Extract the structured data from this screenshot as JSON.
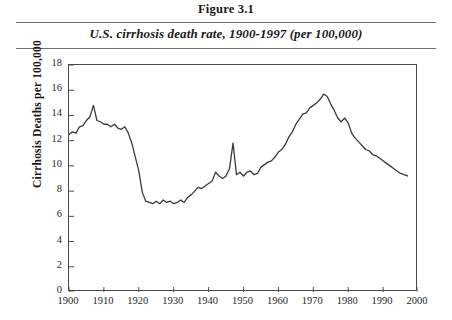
{
  "header": {
    "figure_number": "Figure 3.1",
    "title": "U.S. cirrhosis death rate, 1900-1997 (per 100,000)"
  },
  "chart_data": {
    "type": "line",
    "title": "U.S. cirrhosis death rate, 1900-1997 (per 100,000)",
    "figure_number": "Figure 3.1",
    "xlabel": "",
    "ylabel": "Cirrhosis Deaths per 100,000",
    "xlim": [
      1900,
      2000
    ],
    "ylim": [
      0,
      18
    ],
    "xticks": [
      1900,
      1910,
      1920,
      1930,
      1940,
      1950,
      1960,
      1970,
      1980,
      1990,
      2000
    ],
    "yticks": [
      0,
      2,
      4,
      6,
      8,
      10,
      12,
      14,
      16,
      18
    ],
    "xtick_labels": [
      "1900",
      "1910",
      "1920",
      "1930",
      "1940",
      "1950",
      "1960",
      "1970",
      "1980",
      "1990",
      "2000"
    ],
    "ytick_labels": [
      "0",
      "2",
      "4",
      "6",
      "8",
      "10",
      "12",
      "14",
      "16",
      "18"
    ],
    "grid": false,
    "legend": false,
    "line_color": "#3a3a3a",
    "line_width": 1.3,
    "series": [
      {
        "name": "U.S. cirrhosis death rate",
        "x": [
          1900,
          1901,
          1902,
          1903,
          1904,
          1905,
          1906,
          1907,
          1908,
          1909,
          1910,
          1911,
          1912,
          1913,
          1914,
          1915,
          1916,
          1917,
          1918,
          1919,
          1920,
          1921,
          1922,
          1923,
          1924,
          1925,
          1926,
          1927,
          1928,
          1929,
          1930,
          1931,
          1932,
          1933,
          1934,
          1935,
          1936,
          1937,
          1938,
          1939,
          1940,
          1941,
          1942,
          1943,
          1944,
          1945,
          1946,
          1947,
          1948,
          1949,
          1950,
          1951,
          1952,
          1953,
          1954,
          1955,
          1956,
          1957,
          1958,
          1959,
          1960,
          1961,
          1962,
          1963,
          1964,
          1965,
          1966,
          1967,
          1968,
          1969,
          1970,
          1971,
          1972,
          1973,
          1974,
          1975,
          1976,
          1977,
          1978,
          1979,
          1980,
          1981,
          1982,
          1983,
          1984,
          1985,
          1986,
          1987,
          1988,
          1989,
          1990,
          1991,
          1992,
          1993,
          1994,
          1995,
          1996,
          1997
        ],
        "values": [
          12.5,
          12.7,
          12.6,
          13.1,
          13.2,
          13.6,
          13.9,
          14.8,
          13.6,
          13.5,
          13.3,
          13.3,
          13.1,
          13.3,
          13.0,
          12.9,
          13.1,
          12.6,
          11.8,
          10.7,
          9.6,
          7.9,
          7.2,
          7.1,
          7.0,
          7.2,
          7.0,
          7.3,
          7.1,
          7.2,
          7.0,
          7.1,
          7.3,
          7.1,
          7.5,
          7.7,
          8.0,
          8.3,
          8.2,
          8.4,
          8.6,
          8.8,
          9.5,
          9.2,
          9.0,
          9.2,
          9.8,
          11.8,
          9.3,
          9.5,
          9.2,
          9.5,
          9.6,
          9.3,
          9.4,
          9.9,
          10.1,
          10.3,
          10.4,
          10.7,
          11.1,
          11.3,
          11.7,
          12.3,
          12.7,
          13.3,
          13.7,
          14.1,
          14.2,
          14.6,
          14.8,
          15.0,
          15.3,
          15.7,
          15.5,
          14.9,
          14.4,
          13.8,
          13.5,
          13.8,
          13.4,
          12.6,
          12.2,
          11.9,
          11.6,
          11.3,
          11.2,
          10.9,
          10.8,
          10.6,
          10.4,
          10.2,
          10.0,
          9.8,
          9.6,
          9.4,
          9.3,
          9.2
        ]
      }
    ]
  }
}
